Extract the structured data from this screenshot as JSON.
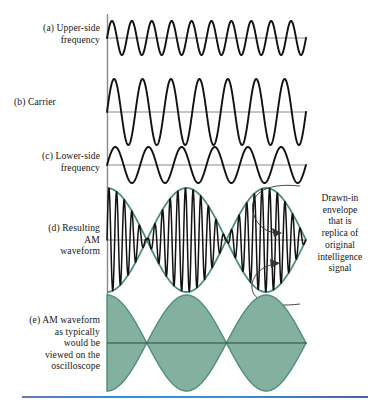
{
  "figure": {
    "colors": {
      "envelope_green": "#4e8f78",
      "fill_green": "#84b0a0",
      "waveform_black": "#111111",
      "axis_gray": "#7d7d7d",
      "rule_blue": "#2f8fe0"
    },
    "panels": [
      {
        "id": "a",
        "label": "(a) Upper-side\nfrequency",
        "label_lines": [
          "(a) Upper-side",
          "frequency"
        ],
        "waveform": "sine",
        "cycles": 10,
        "amplitude": 17
      },
      {
        "id": "b",
        "label": "(b) Carrier",
        "label_lines": [
          "(b) Carrier"
        ],
        "waveform": "sine",
        "cycles": 7,
        "amplitude": 33
      },
      {
        "id": "c",
        "label": "(c) Lower-side\nfrequency",
        "label_lines": [
          "(c) Lower-side",
          "frequency"
        ],
        "waveform": "sine",
        "cycles": 6,
        "amplitude": 18
      },
      {
        "id": "d",
        "label": "(d) Resulting\nAM\nwaveform",
        "label_lines": [
          "(d) Resulting",
          "AM",
          "waveform"
        ],
        "waveform": "am-modulated",
        "carrier_cycles": 7,
        "modulation_cycles": 2.5,
        "amplitude": 52
      },
      {
        "id": "e",
        "label": "(e) AM waveform\nas typically\nwould be\nviewed on the\noscilloscope",
        "label_lines": [
          "(e) AM waveform",
          "as typically",
          "would be",
          "viewed on the",
          "oscilloscope"
        ],
        "waveform": "am-filled-envelope",
        "modulation_cycles": 2.5,
        "amplitude": 48
      }
    ],
    "annotation": {
      "text": "Drawn-in envelope that is replica of original intelligence signal",
      "lines": [
        "Drawn-in",
        "envelope",
        "that is",
        "replica of",
        "original",
        "intelligence",
        "signal"
      ],
      "leader_count": 2
    }
  },
  "chart_data": {
    "type": "line",
    "xlabel": "",
    "ylabel": "",
    "series": [
      {
        "name": "(a) Upper-side frequency",
        "type": "sine",
        "cycles": 10,
        "amplitude": 0.33
      },
      {
        "name": "(b) Carrier",
        "type": "sine",
        "cycles": 7,
        "amplitude": 1.0
      },
      {
        "name": "(c) Lower-side frequency",
        "type": "sine",
        "cycles": 6,
        "amplitude": 0.35
      },
      {
        "name": "(d) Resulting AM waveform",
        "type": "am",
        "carrier_cycles": 7,
        "modulation_cycles": 2.5,
        "amplitude": 1.0
      },
      {
        "name": "(e) AM waveform as viewed on oscilloscope",
        "type": "am-envelope",
        "modulation_cycles": 2.5,
        "amplitude": 1.0
      }
    ],
    "grid": false,
    "legend": "none"
  }
}
